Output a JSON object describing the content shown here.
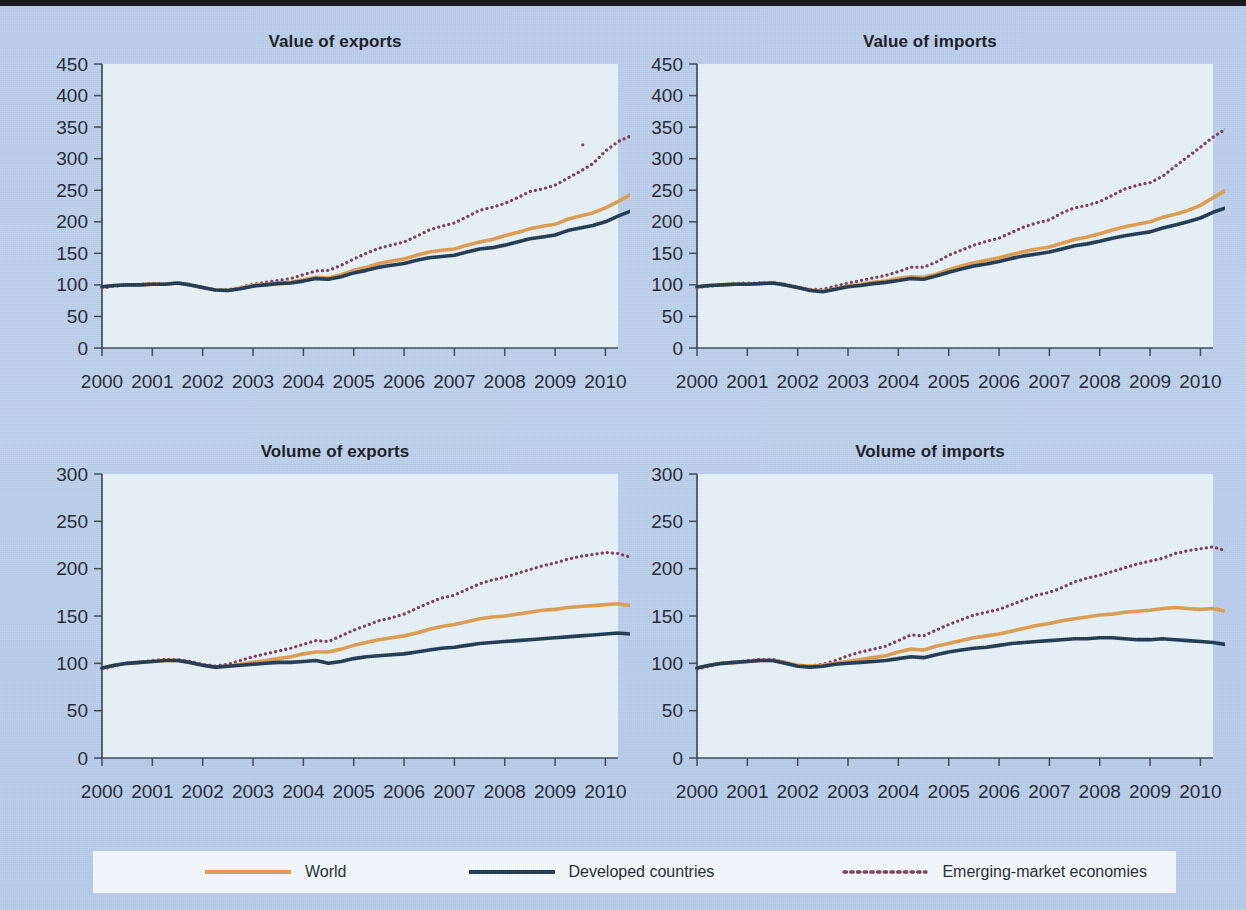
{
  "figure": {
    "background_color": "#b9cdea",
    "plot_background_color": "#e6f1f8"
  },
  "legend": {
    "position": "bottom",
    "items": [
      {
        "label": "World",
        "color": "#dd9b4e",
        "style": "solid"
      },
      {
        "label": "Developed countries",
        "color": "#1e3850",
        "style": "solid"
      },
      {
        "label": "Emerging-market economies",
        "color": "#7b3b57",
        "style": "dotted"
      }
    ]
  },
  "chart_data": [
    {
      "id": "value-of-exports",
      "type": "line",
      "title": "Value of exports",
      "xlabel": "",
      "ylabel": "",
      "xlim": [
        2000,
        2010.25
      ],
      "ylim": [
        0,
        450
      ],
      "yticks": [
        0,
        50,
        100,
        150,
        200,
        250,
        300,
        350,
        400,
        450
      ],
      "xticks": [
        2000,
        2001,
        2002,
        2003,
        2004,
        2005,
        2006,
        2007,
        2008,
        2009,
        2010
      ],
      "xtick_labels": [
        "2000",
        "2001",
        "2002",
        "2003",
        "2004",
        "2005",
        "2006",
        "2007",
        "2008",
        "2009",
        "2010"
      ],
      "grid": false,
      "x_start": 2000,
      "x_step": 0.25,
      "series": [
        {
          "name": "World",
          "color": "#dd9b4e",
          "style": "solid",
          "values": [
            97,
            99,
            100,
            100,
            101,
            101,
            103,
            100,
            96,
            92,
            91,
            95,
            99,
            101,
            103,
            104,
            108,
            112,
            111,
            116,
            123,
            128,
            134,
            138,
            141,
            147,
            152,
            155,
            157,
            163,
            168,
            172,
            178,
            183,
            189,
            193,
            196,
            204,
            209,
            214,
            222,
            232,
            243,
            256,
            265,
            271,
            259,
            222,
            182,
            173,
            176,
            187,
            198,
            208,
            218,
            227,
            230
          ]
        },
        {
          "name": "Developed countries",
          "color": "#1e3850",
          "style": "solid",
          "values": [
            97,
            99,
            100,
            100,
            101,
            101,
            103,
            100,
            96,
            92,
            91,
            94,
            98,
            100,
            102,
            103,
            106,
            110,
            109,
            113,
            119,
            123,
            128,
            131,
            134,
            139,
            143,
            145,
            147,
            152,
            157,
            159,
            163,
            168,
            173,
            176,
            179,
            186,
            190,
            194,
            200,
            209,
            217,
            223,
            224,
            225,
            212,
            181,
            150,
            144,
            148,
            157,
            165,
            172,
            176,
            179,
            182
          ]
        },
        {
          "name": "Emerging-market economies",
          "color": "#7b3b57",
          "style": "dotted",
          "values": [
            95,
            98,
            100,
            101,
            102,
            101,
            103,
            100,
            96,
            92,
            92,
            96,
            101,
            104,
            107,
            110,
            116,
            122,
            123,
            131,
            141,
            150,
            158,
            163,
            168,
            177,
            187,
            193,
            198,
            208,
            218,
            223,
            229,
            238,
            248,
            252,
            258,
            269,
            280,
            292,
            312,
            327,
            336,
            348,
            354,
            348,
            320,
            268,
            227,
            226,
            227,
            240,
            258,
            276,
            290,
            302,
            312
          ]
        }
      ]
    },
    {
      "id": "value-of-imports",
      "type": "line",
      "title": "Value of imports",
      "xlabel": "",
      "ylabel": "",
      "xlim": [
        2000,
        2010.25
      ],
      "ylim": [
        0,
        450
      ],
      "yticks": [
        0,
        50,
        100,
        150,
        200,
        250,
        300,
        350,
        400,
        450
      ],
      "xticks": [
        2000,
        2001,
        2002,
        2003,
        2004,
        2005,
        2006,
        2007,
        2008,
        2009,
        2010
      ],
      "xtick_labels": [
        "2000",
        "2001",
        "2002",
        "2003",
        "2004",
        "2005",
        "2006",
        "2007",
        "2008",
        "2009",
        "2010"
      ],
      "grid": false,
      "x_start": 2000,
      "x_step": 0.25,
      "series": [
        {
          "name": "World",
          "color": "#dd9b4e",
          "style": "solid",
          "values": [
            97,
            99,
            100,
            101,
            101,
            102,
            103,
            100,
            96,
            92,
            90,
            94,
            98,
            101,
            104,
            106,
            110,
            113,
            112,
            117,
            124,
            130,
            135,
            139,
            143,
            148,
            153,
            157,
            160,
            166,
            172,
            176,
            181,
            187,
            192,
            196,
            200,
            207,
            212,
            218,
            226,
            238,
            250,
            262,
            267,
            272,
            262,
            224,
            180,
            172,
            175,
            186,
            197,
            208,
            216,
            222,
            226
          ]
        },
        {
          "name": "Developed countries",
          "color": "#1e3850",
          "style": "solid",
          "values": [
            97,
            99,
            100,
            101,
            101,
            102,
            103,
            100,
            96,
            91,
            89,
            93,
            97,
            99,
            102,
            104,
            107,
            110,
            109,
            114,
            120,
            125,
            130,
            133,
            137,
            142,
            146,
            149,
            152,
            157,
            162,
            165,
            169,
            174,
            178,
            181,
            184,
            190,
            195,
            200,
            206,
            215,
            222,
            228,
            231,
            232,
            221,
            186,
            152,
            146,
            148,
            157,
            165,
            172,
            176,
            177,
            179
          ]
        },
        {
          "name": "Emerging-market economies",
          "color": "#7b3b57",
          "style": "dotted",
          "values": [
            96,
            98,
            100,
            102,
            103,
            103,
            104,
            101,
            97,
            93,
            93,
            98,
            103,
            107,
            111,
            115,
            121,
            128,
            128,
            136,
            147,
            155,
            163,
            169,
            174,
            183,
            192,
            198,
            203,
            214,
            222,
            226,
            232,
            242,
            252,
            258,
            262,
            272,
            288,
            303,
            318,
            334,
            347,
            350,
            356,
            352,
            322,
            268,
            230,
            228,
            233,
            247,
            268,
            288,
            303,
            315,
            325
          ]
        }
      ]
    },
    {
      "id": "volume-of-exports",
      "type": "line",
      "title": "Volume of exports",
      "xlabel": "",
      "ylabel": "",
      "xlim": [
        2000,
        2010.25
      ],
      "ylim": [
        0,
        300
      ],
      "yticks": [
        0,
        50,
        100,
        150,
        200,
        250,
        300
      ],
      "xticks": [
        2000,
        2001,
        2002,
        2003,
        2004,
        2005,
        2006,
        2007,
        2008,
        2009,
        2010
      ],
      "xtick_labels": [
        "2000",
        "2001",
        "2002",
        "2003",
        "2004",
        "2005",
        "2006",
        "2007",
        "2008",
        "2009",
        "2010"
      ],
      "grid": false,
      "x_start": 2000,
      "x_step": 0.25,
      "series": [
        {
          "name": "World",
          "color": "#dd9b4e",
          "style": "solid",
          "values": [
            95,
            98,
            100,
            101,
            102,
            103,
            103,
            101,
            98,
            96,
            97,
            99,
            101,
            103,
            105,
            107,
            110,
            112,
            112,
            115,
            119,
            122,
            125,
            127,
            129,
            132,
            136,
            139,
            141,
            144,
            147,
            149,
            150,
            152,
            154,
            156,
            157,
            159,
            160,
            161,
            162,
            163,
            161,
            160,
            157,
            156,
            150,
            133,
            129,
            132,
            136,
            140,
            143,
            147,
            150,
            153,
            156
          ]
        },
        {
          "name": "Developed countries",
          "color": "#1e3850",
          "style": "solid",
          "values": [
            95,
            98,
            100,
            101,
            102,
            103,
            103,
            101,
            98,
            96,
            97,
            98,
            99,
            100,
            101,
            101,
            102,
            103,
            100,
            102,
            105,
            107,
            108,
            109,
            110,
            112,
            114,
            116,
            117,
            119,
            121,
            122,
            123,
            124,
            125,
            126,
            127,
            128,
            129,
            130,
            131,
            132,
            131,
            132,
            130,
            129,
            126,
            110,
            102,
            103,
            105,
            108,
            110,
            112,
            114,
            117,
            120
          ]
        },
        {
          "name": "Emerging-market economies",
          "color": "#7b3b57",
          "style": "dotted",
          "values": [
            94,
            97,
            100,
            101,
            103,
            104,
            104,
            102,
            99,
            97,
            99,
            103,
            107,
            110,
            113,
            116,
            120,
            124,
            123,
            129,
            135,
            140,
            145,
            148,
            152,
            158,
            164,
            169,
            172,
            178,
            184,
            188,
            191,
            195,
            199,
            203,
            206,
            210,
            213,
            215,
            217,
            216,
            212,
            208,
            205,
            199,
            185,
            174,
            178,
            183,
            185,
            190,
            198,
            205,
            211,
            216,
            221
          ]
        }
      ]
    },
    {
      "id": "volume-of-imports",
      "type": "line",
      "title": "Volume of imports",
      "xlabel": "",
      "ylabel": "",
      "xlim": [
        2000,
        2010.25
      ],
      "ylim": [
        0,
        300
      ],
      "yticks": [
        0,
        50,
        100,
        150,
        200,
        250,
        300
      ],
      "xticks": [
        2000,
        2001,
        2002,
        2003,
        2004,
        2005,
        2006,
        2007,
        2008,
        2009,
        2010
      ],
      "xtick_labels": [
        "2000",
        "2001",
        "2002",
        "2003",
        "2004",
        "2005",
        "2006",
        "2007",
        "2008",
        "2009",
        "2010"
      ],
      "grid": false,
      "x_start": 2000,
      "x_step": 0.25,
      "series": [
        {
          "name": "World",
          "color": "#dd9b4e",
          "style": "solid",
          "values": [
            95,
            98,
            100,
            101,
            102,
            103,
            103,
            101,
            98,
            97,
            98,
            100,
            102,
            104,
            106,
            108,
            112,
            115,
            114,
            118,
            121,
            124,
            127,
            129,
            131,
            134,
            137,
            140,
            142,
            145,
            147,
            149,
            151,
            152,
            154,
            155,
            156,
            158,
            159,
            158,
            157,
            158,
            155,
            152,
            149,
            147,
            140,
            126,
            124,
            128,
            133,
            138,
            142,
            145,
            148,
            151,
            152
          ]
        },
        {
          "name": "Developed countries",
          "color": "#1e3850",
          "style": "solid",
          "values": [
            95,
            98,
            100,
            101,
            102,
            103,
            103,
            100,
            97,
            96,
            97,
            99,
            100,
            101,
            102,
            103,
            105,
            107,
            106,
            109,
            112,
            114,
            116,
            117,
            119,
            121,
            122,
            123,
            124,
            125,
            126,
            126,
            127,
            127,
            126,
            125,
            125,
            126,
            125,
            124,
            123,
            122,
            120,
            117,
            112,
            108,
            103,
            100,
            100,
            102,
            105,
            107,
            109,
            111,
            113,
            115,
            114
          ]
        },
        {
          "name": "Emerging-market economies",
          "color": "#7b3b57",
          "style": "dotted",
          "values": [
            94,
            97,
            100,
            101,
            103,
            104,
            104,
            101,
            98,
            97,
            99,
            103,
            108,
            112,
            115,
            118,
            124,
            130,
            129,
            135,
            141,
            146,
            151,
            154,
            157,
            162,
            167,
            172,
            175,
            180,
            186,
            190,
            193,
            197,
            201,
            205,
            208,
            211,
            216,
            219,
            221,
            223,
            219,
            214,
            207,
            196,
            180,
            170,
            172,
            179,
            186,
            190,
            196,
            205,
            214,
            223,
            230
          ]
        }
      ]
    }
  ]
}
